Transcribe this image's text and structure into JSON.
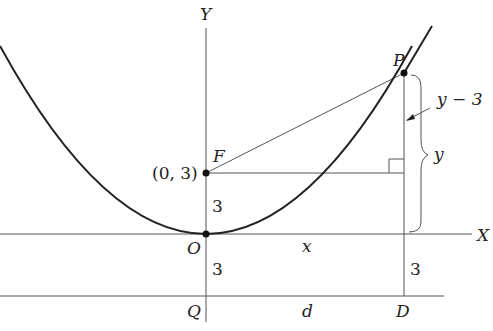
{
  "diagram": {
    "type": "parabola-focus-directrix",
    "axes": {
      "x_label": "X",
      "y_label": "Y"
    },
    "points": {
      "origin": "O",
      "focus": "F",
      "focus_coords": "(0, 3)",
      "point_on_curve": "P",
      "directrix_foot_q": "Q",
      "directrix_foot_d": "D"
    },
    "segment_labels": {
      "focus_to_origin": "3",
      "origin_to_directrix": "3",
      "x_axis_to_directrix_at_d": "3",
      "horizontal_distance_x": "x",
      "horizontal_distance_d": "d",
      "vertical_y_minus_3": "y − 3",
      "vertical_y": "y"
    }
  }
}
